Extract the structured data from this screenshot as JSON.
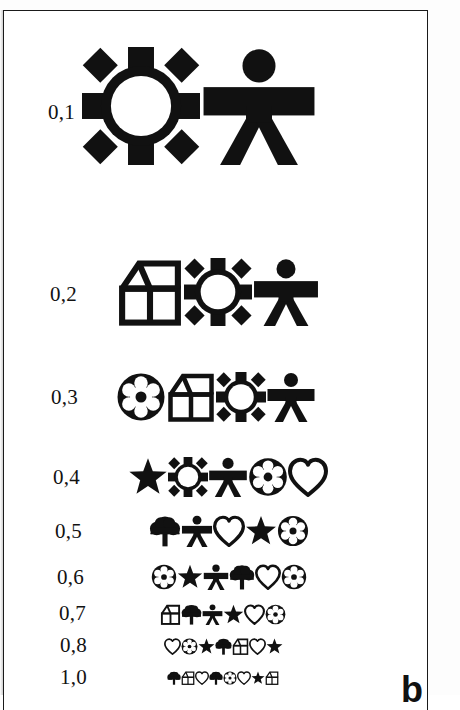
{
  "figure": {
    "panel_letter": "b",
    "kind": "lea-symbols-visual-acuity-chart",
    "ink_color": "#111111",
    "background_color": "#ffffff",
    "frame_color": "#1a1a1a"
  },
  "rows": [
    {
      "acuity": "0,1",
      "label_x": 44,
      "label_y": 103,
      "label_size": 21,
      "symbol_size": 118,
      "gap": 106,
      "symbols_x": 78,
      "symbols_y": 95,
      "symbols": [
        "circle",
        "person"
      ]
    },
    {
      "acuity": "0,2",
      "label_x": 46,
      "label_y": 285,
      "label_size": 21,
      "symbol_size": 68,
      "gap": 62,
      "symbols_x": 112,
      "symbols_y": 281,
      "symbols": [
        "house",
        "circle",
        "person"
      ]
    },
    {
      "acuity": "0,3",
      "label_x": 47,
      "label_y": 388,
      "label_size": 21,
      "symbol_size": 50,
      "gap": 40,
      "symbols_x": 112,
      "symbols_y": 386,
      "symbols": [
        "ball",
        "house",
        "circle",
        "person"
      ]
    },
    {
      "acuity": "0,4",
      "label_x": 49,
      "label_y": 468,
      "label_size": 21,
      "symbol_size": 40,
      "gap": 29,
      "symbols_x": 124,
      "symbols_y": 466,
      "symbols": [
        "star",
        "circle",
        "person",
        "ball",
        "heart"
      ]
    },
    {
      "acuity": "0,5",
      "label_x": 51,
      "label_y": 522,
      "label_size": 21,
      "symbol_size": 32,
      "gap": 24,
      "symbols_x": 145,
      "symbols_y": 520,
      "symbols": [
        "tree",
        "person",
        "heart",
        "star",
        "ball"
      ]
    },
    {
      "acuity": "0,6",
      "label_x": 53,
      "label_y": 568,
      "label_size": 21,
      "symbol_size": 26,
      "gap": 19,
      "symbols_x": 147,
      "symbols_y": 566,
      "symbols": [
        "ball",
        "star",
        "person",
        "tree",
        "heart",
        "ball"
      ]
    },
    {
      "acuity": "0,7",
      "label_x": 55,
      "label_y": 604,
      "label_size": 21,
      "symbol_size": 21,
      "gap": 15,
      "symbols_x": 156,
      "symbols_y": 603,
      "symbols": [
        "house",
        "tree",
        "person",
        "star",
        "heart",
        "ball"
      ]
    },
    {
      "acuity": "0,8",
      "label_x": 56,
      "label_y": 636,
      "label_size": 21,
      "symbol_size": 17,
      "gap": 12,
      "symbols_x": 160,
      "symbols_y": 635,
      "symbols": [
        "heart",
        "ball",
        "star",
        "tree",
        "house",
        "heart",
        "star"
      ]
    },
    {
      "acuity": "1,0",
      "label_x": 56,
      "label_y": 668,
      "label_size": 21,
      "symbol_size": 14,
      "gap": 10,
      "symbols_x": 163,
      "symbols_y": 667,
      "symbols": [
        "tree",
        "house",
        "heart",
        "tree",
        "ball",
        "heart",
        "star",
        "house"
      ]
    }
  ],
  "symbol_names": {
    "circle": "circle-symbol",
    "person": "person-symbol",
    "house": "house-symbol",
    "ball": "ball-symbol",
    "star": "star-symbol",
    "heart": "heart-symbol",
    "tree": "tree-symbol"
  }
}
